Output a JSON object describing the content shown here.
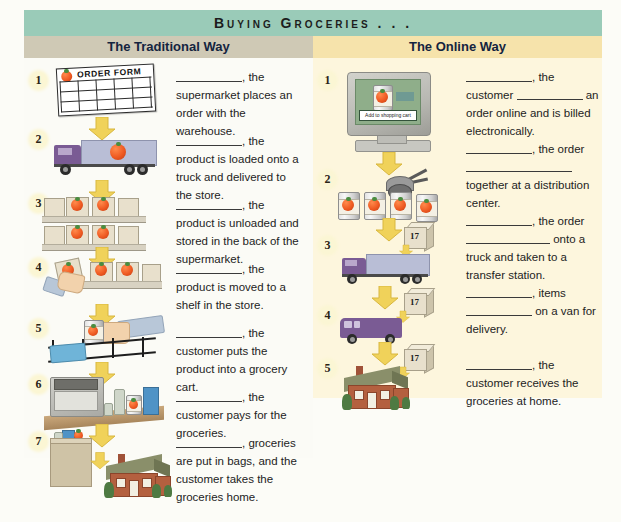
{
  "banner": {
    "title": "Buying Groceries . . ."
  },
  "columns": {
    "left": {
      "header": "The Traditional Way",
      "header_bg": "#cfc9b5",
      "steps": [
        "1",
        "2",
        "3",
        "4",
        "5",
        "6",
        "7"
      ],
      "paragraphs": [
        {
          "lead_blank": "long",
          "text": ", the supermarket places an order with the warehouse."
        },
        {
          "lead_blank": "long",
          "text": ", the product is loaded onto a truck and delivered to the store."
        },
        {
          "lead_blank": "long",
          "text": ", the product is unloaded and stored in the back of the supermarket."
        },
        {
          "lead_blank": "long",
          "text": ", the product is moved to a shelf in the store."
        },
        {
          "lead_blank": "long",
          "text": ", the customer puts the product into a grocery cart."
        },
        {
          "lead_blank": "long",
          "text": ", the customer pays for the groceries."
        },
        {
          "lead_blank": "long",
          "text": ", groceries are put in bags, and the customer takes the groceries home."
        }
      ],
      "artwork": [
        "order-form-illustration",
        "delivery-truck-illustration",
        "stocked-shelves-illustration",
        "hand-shelving-product-illustration",
        "hand-placing-item-in-cart-illustration",
        "cash-register-illustration",
        "grocery-bag-and-house-illustration"
      ]
    },
    "right": {
      "header": "The Online Way",
      "header_bg": "#f6e3ab",
      "body_bg": "#fdf6dd",
      "steps": [
        "1",
        "2",
        "3",
        "4",
        "5"
      ],
      "paragraphs": [
        {
          "segments": [
            "blank",
            ", the customer ",
            "blank",
            " an order online and is billed electronically."
          ]
        },
        {
          "segments": [
            "blank",
            ", the order ",
            "blank",
            " ",
            "blank",
            " together at a distribution center."
          ]
        },
        {
          "segments": [
            "blank",
            ", the order ",
            "blank",
            " onto a truck and taken to a transfer station."
          ]
        },
        {
          "segments": [
            "blank",
            ", items ",
            "blank",
            " on a van for delivery."
          ]
        },
        {
          "segments": [
            "blank",
            ", the customer receives the groceries at home."
          ]
        }
      ],
      "artwork": [
        "computer-order-screen-illustration",
        "robot-picker-with-cans-illustration",
        "truck-with-package-illustration",
        "delivery-van-with-package-illustration",
        "house-delivery-illustration"
      ],
      "screen_button": "Add to shopping cart",
      "package_label": "17"
    }
  },
  "order_form": {
    "title": "ORDER FORM"
  },
  "colors": {
    "banner": "#9acbb8",
    "left_header": "#cfc9b5",
    "right_header": "#f6e3ab",
    "right_body": "#fdf6dd",
    "page": "#fcfcf7",
    "arrow": "#f0d25a",
    "heading_text": "#14243f"
  }
}
